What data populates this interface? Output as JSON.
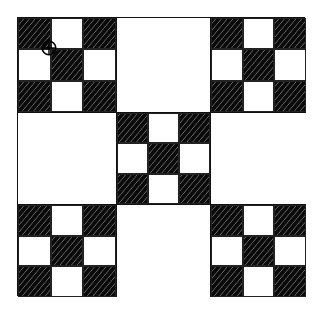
{
  "diagram": {
    "type": "quilt-pattern",
    "layout": "3x3 blocks alternating nine-patch and plain squares",
    "colors": {
      "dark": "#0a0a0a",
      "light": "#ffffff",
      "outline": "#111111"
    },
    "blocks": [
      {
        "row": 0,
        "col": 0,
        "kind": "ninepatch",
        "cells": [
          "dark",
          "light",
          "dark",
          "light",
          "dark",
          "light",
          "dark",
          "light",
          "dark"
        ]
      },
      {
        "row": 0,
        "col": 1,
        "kind": "plain"
      },
      {
        "row": 0,
        "col": 2,
        "kind": "ninepatch",
        "cells": [
          "dark",
          "light",
          "dark",
          "light",
          "dark",
          "light",
          "dark",
          "light",
          "dark"
        ]
      },
      {
        "row": 1,
        "col": 0,
        "kind": "plain"
      },
      {
        "row": 1,
        "col": 1,
        "kind": "ninepatch",
        "cells": [
          "dark",
          "light",
          "dark",
          "light",
          "dark",
          "light",
          "dark",
          "light",
          "dark"
        ]
      },
      {
        "row": 1,
        "col": 2,
        "kind": "plain"
      },
      {
        "row": 2,
        "col": 0,
        "kind": "ninepatch",
        "cells": [
          "dark",
          "light",
          "dark",
          "light",
          "dark",
          "light",
          "dark",
          "light",
          "dark"
        ]
      },
      {
        "row": 2,
        "col": 1,
        "kind": "plain"
      },
      {
        "row": 2,
        "col": 2,
        "kind": "ninepatch",
        "cells": [
          "dark",
          "light",
          "dark",
          "light",
          "dark",
          "light",
          "dark",
          "light",
          "dark"
        ]
      }
    ],
    "marker": {
      "icon": "crosshair-circle-icon",
      "block": "top-left",
      "position": "intersection of first row and first column cells"
    }
  }
}
